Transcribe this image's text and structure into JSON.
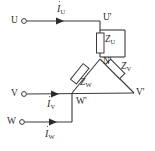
{
  "diagram": {
    "type": "circuit-schematic",
    "colors": {
      "wire": "#3a3a3a",
      "text": "#2b2b2b",
      "background": "#ffffff"
    },
    "terminals": [
      {
        "id": "U",
        "label": "U",
        "x": 12,
        "y": 21
      },
      {
        "id": "V",
        "label": "V",
        "x": 12,
        "y": 94
      },
      {
        "id": "W",
        "label": "W",
        "x": 10,
        "y": 122
      }
    ],
    "nodes": [
      {
        "id": "U-prime",
        "label": "U'",
        "x": 106,
        "y": 19
      },
      {
        "id": "N-prime",
        "label": "N'",
        "x": 103,
        "y": 62
      },
      {
        "id": "V-prime",
        "label": "V'",
        "x": 136,
        "y": 93
      },
      {
        "id": "W-prime",
        "label": "W'",
        "x": 74,
        "y": 99
      }
    ],
    "currents": [
      {
        "id": "I-U",
        "symbol": "I",
        "subscript": "U",
        "label": "İU",
        "x": 56,
        "y": 6
      },
      {
        "id": "I-V",
        "symbol": "I",
        "subscript": "V",
        "label": "İV",
        "x": 46,
        "y": 101
      },
      {
        "id": "I-W",
        "symbol": "I",
        "subscript": "W",
        "label": "İW",
        "x": 44,
        "y": 131
      }
    ],
    "impedances": [
      {
        "id": "Z-U",
        "symbol": "Z",
        "subscript": "U",
        "label": "ZU",
        "branch": "U'-N'",
        "x": 104,
        "y": 36
      },
      {
        "id": "Z-V",
        "symbol": "Z",
        "subscript": "V",
        "label": "ZV",
        "branch": "N'-V'",
        "x": 122,
        "y": 66
      },
      {
        "id": "Z-W",
        "symbol": "Z",
        "subscript": "W",
        "label": "ZW",
        "branch": "N'-W'",
        "x": 79,
        "y": 80
      }
    ]
  }
}
